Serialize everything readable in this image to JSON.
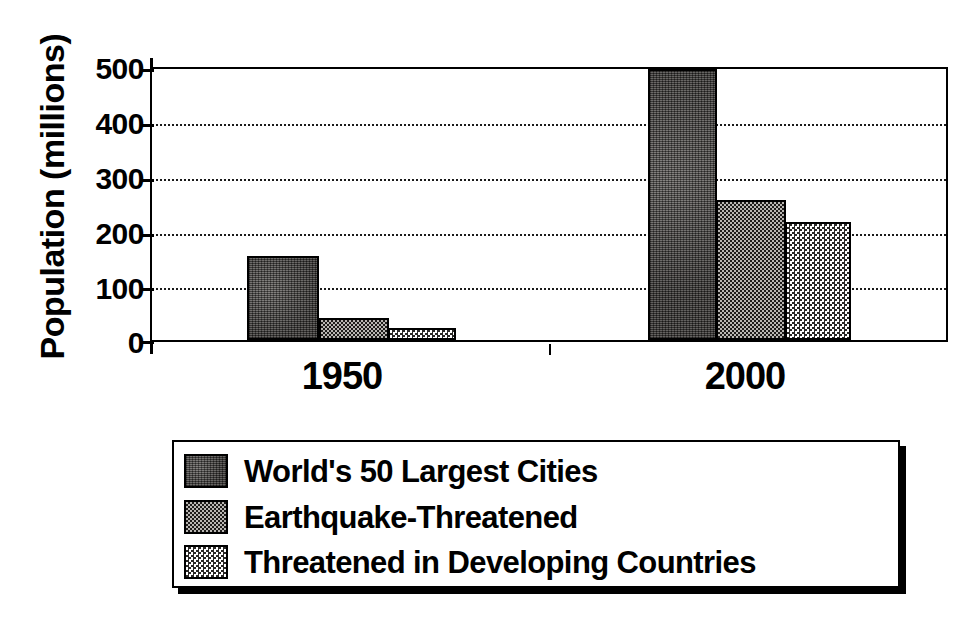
{
  "chart_data": {
    "type": "bar",
    "title": "",
    "subtitle": "",
    "xlabel": "",
    "ylabel": "Population (millions)",
    "categories": [
      "1950",
      "2000"
    ],
    "ylim": [
      0,
      500
    ],
    "yticks": [
      "0",
      "100",
      "200",
      "300",
      "400",
      "500"
    ],
    "grid": true,
    "legend_position": "bottom",
    "series": [
      {
        "name": "World's 50 Largest Cities",
        "values": [
          155,
          500
        ],
        "swatch": "dark-mottled"
      },
      {
        "name": "Earthquake-Threatened",
        "values": [
          40,
          258
        ],
        "swatch": "medium-checker"
      },
      {
        "name": "Threatened in Developing Countries",
        "values": [
          22,
          218
        ],
        "swatch": "light-checker"
      }
    ],
    "colors": {
      "series_1": "#4d4a47",
      "series_2": "#6e6b68",
      "series_3": "#d8d6d2",
      "axis": "#000000",
      "grid": "#1a1a1a",
      "background": "#ffffff"
    }
  },
  "axis": {
    "y_title": "Population (millions)",
    "y_ticks": [
      {
        "label": "500",
        "value": 500
      },
      {
        "label": "400",
        "value": 400
      },
      {
        "label": "300",
        "value": 300
      },
      {
        "label": "200",
        "value": 200
      },
      {
        "label": "100",
        "value": 100
      },
      {
        "label": "0",
        "value": 0
      }
    ],
    "x_ticks": [
      {
        "label": "1950"
      },
      {
        "label": "2000"
      }
    ]
  },
  "legend": {
    "items": [
      {
        "label": "World's 50 Largest Cities"
      },
      {
        "label": "Earthquake-Threatened"
      },
      {
        "label": "Threatened in Developing Countries"
      }
    ]
  }
}
